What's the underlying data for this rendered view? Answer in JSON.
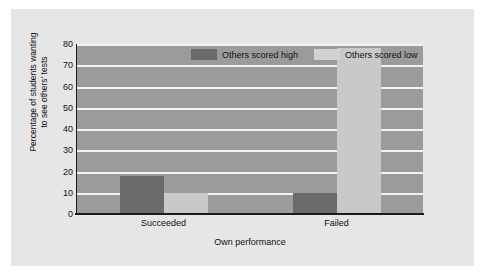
{
  "chart_data": {
    "type": "bar",
    "title": "",
    "xlabel": "Own performance",
    "ylabel": "Percentage of students wanting to see others' tests",
    "ylabel_line1": "Percentage of students wanting",
    "ylabel_line2": "to see others' tests",
    "categories": [
      "Succeeded",
      "Failed"
    ],
    "series": [
      {
        "name": "Others scored high",
        "color": "#6a6a6a",
        "values": [
          18,
          10
        ]
      },
      {
        "name": "Others scored low",
        "color": "#c9c9c9",
        "values": [
          10,
          78
        ]
      }
    ],
    "ylim": [
      0,
      80
    ],
    "yticks": [
      0,
      10,
      20,
      30,
      40,
      50,
      60,
      70,
      80
    ],
    "ytick_labels": [
      "0",
      "10",
      "20",
      "30",
      "40",
      "50",
      "60",
      "70",
      "80"
    ],
    "grid": true,
    "grid_color": "#f2f2f2",
    "legend_position": "top-center",
    "plot_background": "#9b9b9b",
    "figure_background": "#e6e6e6",
    "axis_color": "#1a1a1a"
  },
  "legend": {
    "entries": [
      {
        "label": "Others scored high"
      },
      {
        "label": "Others scored low"
      }
    ]
  }
}
